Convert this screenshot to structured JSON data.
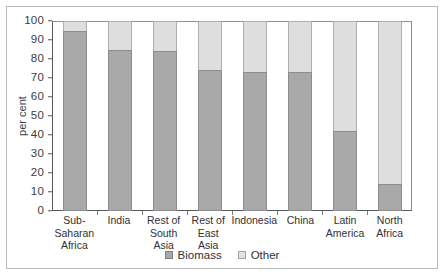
{
  "chart_data": {
    "type": "bar",
    "stacked": true,
    "title": "",
    "xlabel": "",
    "ylabel": "per cent",
    "ylim": [
      0,
      100
    ],
    "yticks": [
      0,
      10,
      20,
      30,
      40,
      50,
      60,
      70,
      80,
      90,
      100
    ],
    "ytick_labels": [
      "0",
      "10",
      "20",
      "30",
      "40",
      "50",
      "60",
      "70",
      "80",
      "90",
      "100"
    ],
    "grid": false,
    "legend_position": "bottom-center",
    "categories": [
      "Sub-Saharan Africa",
      "India",
      "Rest of South Asia",
      "Rest of East Asia",
      "Indonesia",
      "China",
      "Latin America",
      "North Africa"
    ],
    "category_lines": [
      [
        "Sub-Saharan",
        "Africa"
      ],
      [
        "India",
        ""
      ],
      [
        "Rest of",
        "South Asia"
      ],
      [
        "Rest of",
        "East Asia"
      ],
      [
        "Indonesia",
        ""
      ],
      [
        "China",
        ""
      ],
      [
        "Latin",
        "America"
      ],
      [
        "North",
        "Africa"
      ]
    ],
    "series": [
      {
        "name": "Biomass",
        "color": "#a9a9a9",
        "values": [
          95,
          85,
          84,
          74,
          73,
          73,
          42,
          14
        ]
      },
      {
        "name": "Other",
        "color": "#dedede",
        "values": [
          5,
          15,
          16,
          26,
          27,
          27,
          58,
          86
        ]
      }
    ]
  },
  "legend": {
    "items": [
      {
        "label": "Biomass",
        "swatch": "biomass-swatch"
      },
      {
        "label": "Other",
        "swatch": "other-swatch"
      }
    ]
  },
  "axis": {
    "y_title": "per cent"
  }
}
